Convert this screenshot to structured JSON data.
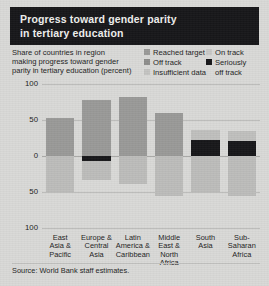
{
  "title": {
    "line1": "Progress toward gender parity",
    "line2": "in tertiary education"
  },
  "subtitle": {
    "line1": "Share of countries in region",
    "line2": "making progress toward gender",
    "line3": "parity in tertiary education (percent)"
  },
  "legend": {
    "column1": [
      {
        "label": "Reached target",
        "color": "#9a9a98",
        "icon": "legend-swatch"
      },
      {
        "label": "Off track",
        "color": "#8e8e8c",
        "icon": "legend-swatch"
      },
      {
        "label": "Insufficient data",
        "color": "#c4c4c2",
        "icon": "legend-swatch"
      }
    ],
    "column2": [
      {
        "label": "On track",
        "color": "#c9c9c7",
        "icon": "legend-swatch"
      },
      {
        "label": "Seriously",
        "label2": "off track",
        "color": "#17171a",
        "icon": "legend-swatch"
      }
    ]
  },
  "source": "Source: World Bank staff estimates.",
  "chart_data": {
    "type": "bar",
    "title": "Progress toward gender parity in tertiary education",
    "subtitle": "Share of countries in region making progress toward gender parity in tertiary education (percent)",
    "xlabel": "",
    "ylabel": "percent",
    "ylim": [
      -100,
      100
    ],
    "yticks": [
      "100",
      "50",
      "0",
      "50",
      "100"
    ],
    "ytick_values": [
      100,
      50,
      0,
      -50,
      -100
    ],
    "grid": true,
    "legend_position": "top-right",
    "diverging": true,
    "note": "Values above zero are positive progress; values below zero are negative (off track / insufficient data).",
    "categories": [
      "East Asia & Pacific",
      "Europe & Central Asia",
      "Latin America & Caribbean",
      "Middle East & North Africa",
      "South Asia",
      "Sub-Saharan Africa"
    ],
    "category_lines": [
      [
        "East",
        "Asia &",
        "Pacific"
      ],
      [
        "Europe &",
        "Central",
        "Asia"
      ],
      [
        "Latin",
        "America &",
        "Caribbean"
      ],
      [
        "Middle",
        "East &",
        "North",
        "Africa"
      ],
      [
        "South",
        "Asia"
      ],
      [
        "Sub-",
        "Saharan",
        "Africa"
      ]
    ],
    "series": [
      {
        "name": "Reached target",
        "color": "#9a9a98",
        "values": [
          53,
          78,
          82,
          60,
          22,
          21
        ]
      },
      {
        "name": "On track",
        "color": "#c9c9c7",
        "values": [
          0,
          0,
          0,
          0,
          14,
          15
        ]
      },
      {
        "name": "Seriously off track",
        "color": "#17171a",
        "values": [
          0,
          -7,
          0,
          0,
          -23,
          -22
        ]
      },
      {
        "name": "Off track",
        "color": "#8e8e8c",
        "values": [
          0,
          0,
          0,
          0,
          0,
          0
        ]
      },
      {
        "name": "Insufficient data",
        "color": "#bdbdbb",
        "values": [
          -50,
          -33,
          -39,
          -55,
          -50,
          -55
        ]
      }
    ]
  },
  "bars": [
    {
      "region": "East Asia & Pacific",
      "segments": [
        {
          "series": "Reached target",
          "color": "#9a9a98",
          "from": 0,
          "to": 53
        },
        {
          "series": "Insufficient data",
          "color": "#bdbdbb",
          "from": -50,
          "to": 0
        }
      ]
    },
    {
      "region": "Europe & Central Asia",
      "segments": [
        {
          "series": "Reached target",
          "color": "#9a9a98",
          "from": 0,
          "to": 78
        },
        {
          "series": "Seriously off track",
          "color": "#17171a",
          "from": -7,
          "to": 0
        },
        {
          "series": "Insufficient data",
          "color": "#bdbdbb",
          "from": -33,
          "to": -7
        }
      ]
    },
    {
      "region": "Latin America & Caribbean",
      "segments": [
        {
          "series": "Reached target",
          "color": "#9a9a98",
          "from": 0,
          "to": 82
        },
        {
          "series": "Insufficient data",
          "color": "#bdbdbb",
          "from": -39,
          "to": 0
        }
      ]
    },
    {
      "region": "Middle East & North Africa",
      "segments": [
        {
          "series": "Reached target",
          "color": "#9a9a98",
          "from": 0,
          "to": 60
        },
        {
          "series": "Insufficient data",
          "color": "#bdbdbb",
          "from": -55,
          "to": 0
        }
      ]
    },
    {
      "region": "South Asia",
      "segments": [
        {
          "series": "On track",
          "color": "#c0c0be",
          "from": 22,
          "to": 36
        },
        {
          "series": "Seriously off track",
          "color": "#17171a",
          "from": 0,
          "to": 22
        },
        {
          "series": "Insufficient data",
          "color": "#bdbdbb",
          "from": -50,
          "to": 0
        }
      ]
    },
    {
      "region": "Sub-Saharan Africa",
      "segments": [
        {
          "series": "On track",
          "color": "#c0c0be",
          "from": 21,
          "to": 35
        },
        {
          "series": "Seriously off track",
          "color": "#17171a",
          "from": 0,
          "to": 21
        },
        {
          "series": "Insufficient data",
          "color": "#bdbdbb",
          "from": -55,
          "to": 0
        }
      ]
    }
  ]
}
